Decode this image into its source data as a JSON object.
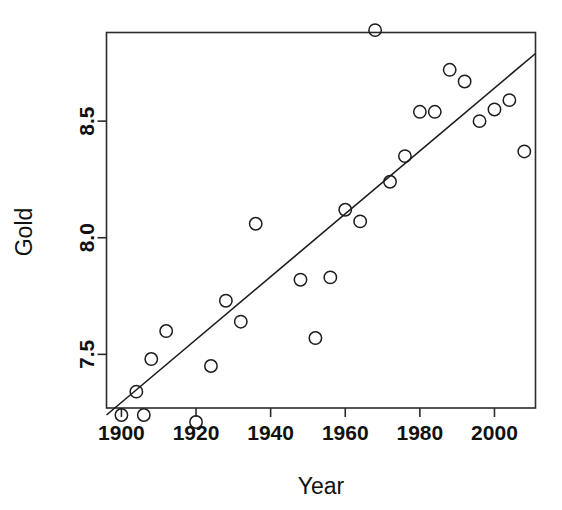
{
  "chart_data": {
    "type": "scatter",
    "title": "",
    "xlabel": "Year",
    "ylabel": "Gold",
    "xlim": [
      1896,
      2011
    ],
    "ylim": [
      7.27,
      8.88
    ],
    "grid": false,
    "legend": null,
    "xticks": [
      1900,
      1920,
      1940,
      1960,
      1980,
      2000
    ],
    "xtick_labels": [
      "1900",
      "1920",
      "1940",
      "1960",
      "1980",
      "2000"
    ],
    "yticks": [
      7.5,
      8.0,
      8.5
    ],
    "ytick_labels": [
      "7.5",
      "8.0",
      "8.5"
    ],
    "marker": "open-circle",
    "point_color": "#1c1c1c",
    "line_color": "#1c1c1c",
    "points": [
      {
        "x": 1900,
        "y": 7.24
      },
      {
        "x": 1904,
        "y": 7.34
      },
      {
        "x": 1906,
        "y": 7.24
      },
      {
        "x": 1908,
        "y": 7.48
      },
      {
        "x": 1912,
        "y": 7.6
      },
      {
        "x": 1920,
        "y": 7.21
      },
      {
        "x": 1924,
        "y": 7.45
      },
      {
        "x": 1928,
        "y": 7.73
      },
      {
        "x": 1932,
        "y": 7.64
      },
      {
        "x": 1936,
        "y": 8.06
      },
      {
        "x": 1948,
        "y": 7.82
      },
      {
        "x": 1952,
        "y": 7.57
      },
      {
        "x": 1956,
        "y": 7.83
      },
      {
        "x": 1960,
        "y": 8.12
      },
      {
        "x": 1964,
        "y": 8.07
      },
      {
        "x": 1968,
        "y": 8.89
      },
      {
        "x": 1972,
        "y": 8.24
      },
      {
        "x": 1976,
        "y": 8.35
      },
      {
        "x": 1980,
        "y": 8.54
      },
      {
        "x": 1984,
        "y": 8.54
      },
      {
        "x": 1988,
        "y": 8.72
      },
      {
        "x": 1992,
        "y": 8.67
      },
      {
        "x": 1996,
        "y": 8.5
      },
      {
        "x": 2000,
        "y": 8.55
      },
      {
        "x": 2004,
        "y": 8.59
      },
      {
        "x": 2008,
        "y": 8.37
      }
    ],
    "fit_line": {
      "type": "linear-regression",
      "x_start": 1896,
      "y_start": 7.24,
      "x_end": 2011,
      "y_end": 8.79
    }
  }
}
